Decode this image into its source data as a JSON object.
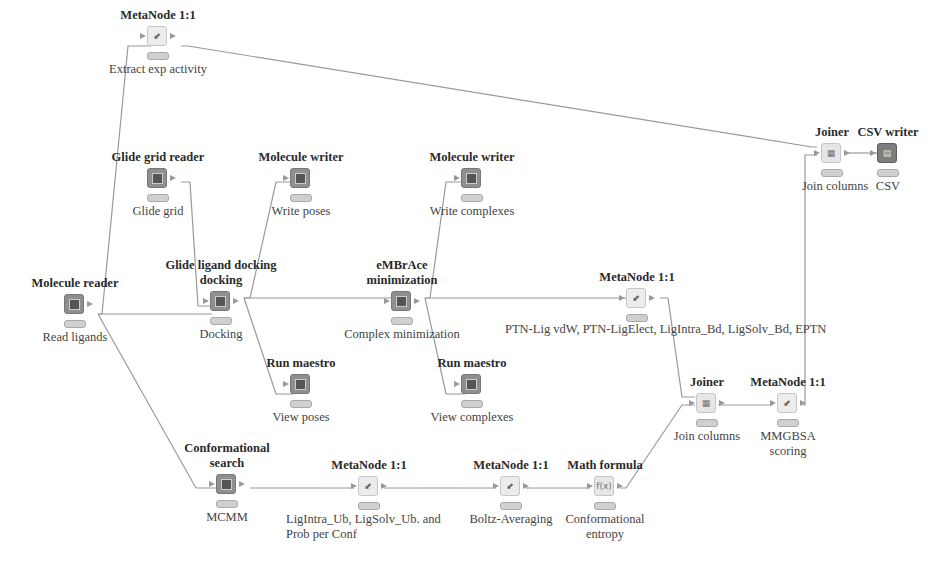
{
  "diagram": {
    "type": "workflow",
    "nodes": [
      {
        "id": "extract",
        "title": "MetaNode 1:1",
        "desc": "Extract exp activity",
        "kind": "meta",
        "x": 158,
        "y": 8
      },
      {
        "id": "gridreader",
        "title": "Glide grid reader",
        "desc": "Glide grid",
        "kind": "source",
        "x": 158,
        "y": 150
      },
      {
        "id": "molreader",
        "title": "Molecule reader",
        "desc": "Read ligands",
        "kind": "source",
        "x": 74,
        "y": 276
      },
      {
        "id": "docking",
        "title": "Glide ligand docking",
        "title2": "docking",
        "desc": "Docking",
        "kind": "source",
        "x": 220,
        "y": 258
      },
      {
        "id": "writeposes",
        "title": "Molecule writer",
        "desc": "Write poses",
        "kind": "source",
        "x": 301,
        "y": 150
      },
      {
        "id": "viewposes",
        "title": "Run maestro",
        "desc": "View poses",
        "kind": "source",
        "x": 301,
        "y": 356
      },
      {
        "id": "minim",
        "title": "eMBrAce",
        "title2": "minimization",
        "desc": "Complex minimization",
        "kind": "source",
        "x": 402,
        "y": 258
      },
      {
        "id": "writecomplex",
        "title": "Molecule writer",
        "desc": "Write complexes",
        "kind": "source",
        "x": 472,
        "y": 150
      },
      {
        "id": "viewcomplex",
        "title": "Run maestro",
        "desc": "View complexes",
        "kind": "source",
        "x": 472,
        "y": 356
      },
      {
        "id": "ptnlig",
        "title": "MetaNode 1:1",
        "desc": "PTN-Lig vdW, PTN-LigElect, LigIntra_Bd, LigSolv_Bd, EPTN",
        "kind": "meta",
        "x": 637,
        "y": 270
      },
      {
        "id": "joiner1",
        "title": "Joiner",
        "desc": "Join columns",
        "kind": "join",
        "x": 825,
        "y": 125
      },
      {
        "id": "csvwriter",
        "title": "CSV writer",
        "desc": "CSV",
        "kind": "csv",
        "x": 885,
        "y": 125
      },
      {
        "id": "joiner2",
        "title": "Joiner",
        "desc": "Join columns",
        "kind": "join",
        "x": 702,
        "y": 375
      },
      {
        "id": "mmgbsa",
        "title": "MetaNode 1:1",
        "desc": "MMGBSA",
        "desc2": "scoring",
        "kind": "meta",
        "x": 780,
        "y": 375
      },
      {
        "id": "confsearch",
        "title": "Conformational",
        "title2": "search",
        "desc": "MCMM",
        "kind": "source",
        "x": 227,
        "y": 441
      },
      {
        "id": "probconf",
        "title": "MetaNode 1:1",
        "desc": "LigIntra_Ub, LigSolv_Ub. and",
        "desc2": "Prob per Conf",
        "kind": "meta",
        "x": 361,
        "y": 458
      },
      {
        "id": "boltz",
        "title": "MetaNode 1:1",
        "desc": "Boltz-Averaging",
        "kind": "meta",
        "x": 503,
        "y": 458
      },
      {
        "id": "mathformula",
        "title": "Math formula",
        "desc": "Conformational",
        "desc2": "entropy",
        "kind": "math",
        "x": 597,
        "y": 458
      }
    ],
    "edge_color": "#9a9a9a",
    "colors": {
      "source_node": "#8f8f8f",
      "meta_node": "#ececec",
      "csv_node": "#7d7d7d",
      "status_bar": "#d0d0d0"
    }
  }
}
